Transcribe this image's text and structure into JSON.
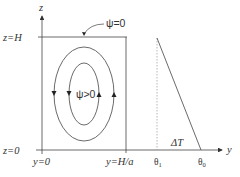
{
  "diagram": {
    "axes": {
      "z_axis_label": "z",
      "y_axis_label": "y"
    },
    "left_labels": {
      "z_top": "z=H",
      "z_bottom": "z=0"
    },
    "bottom_labels": {
      "y_left": "y=0",
      "y_right": "y=H/a",
      "theta1": "θ",
      "theta1_sub": "1",
      "theta0": "θ",
      "theta0_sub": "0"
    },
    "annotations": {
      "psi_boundary": "ψ=0",
      "psi_interior": "ψ>0",
      "delta_t": "ΔT"
    },
    "colors": {
      "line": "#444444",
      "text": "#333333",
      "background": "#ffffff"
    }
  }
}
